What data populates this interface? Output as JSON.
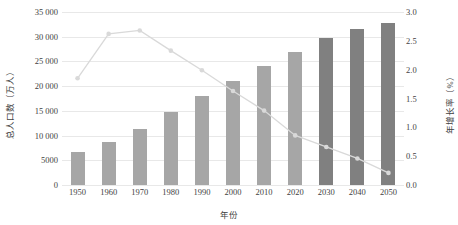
{
  "chart_data": {
    "type": "bar",
    "title": "",
    "xlabel": "年份",
    "ylabel": "总人口数（万人）",
    "y2label": "年增长率（%）",
    "categories": [
      "1950",
      "1960",
      "1970",
      "1980",
      "1990",
      "2000",
      "2010",
      "2020",
      "2030",
      "2040",
      "2050"
    ],
    "ylim": [
      0,
      35000
    ],
    "y2lim": [
      0,
      3.0
    ],
    "yticks": [
      "0",
      "5000",
      "10 000",
      "15 000",
      "20 000",
      "25 000",
      "30 000",
      "35 000"
    ],
    "ytick_values": [
      0,
      5000,
      10000,
      15000,
      20000,
      25000,
      30000,
      35000
    ],
    "y2ticks": [
      "0.0",
      "0.5",
      "1.0",
      "1.5",
      "2.0",
      "2.5",
      "3.0"
    ],
    "y2tick_values": [
      0.0,
      0.5,
      1.0,
      1.5,
      2.0,
      2.5,
      3.0
    ],
    "grid": true,
    "legend": "none",
    "series": [
      {
        "name": "总人口数（万人）",
        "type": "bar",
        "axis": "left",
        "values": [
          6700,
          8700,
          11400,
          14700,
          18000,
          21000,
          24000,
          27000,
          29700,
          31600,
          32800
        ],
        "colors": [
          "hist",
          "hist",
          "hist",
          "hist",
          "hist",
          "hist",
          "hist",
          "hist",
          "proj",
          "proj",
          "proj"
        ]
      },
      {
        "name": "年增长率（%）",
        "type": "line",
        "axis": "right",
        "values": [
          1.85,
          2.62,
          2.68,
          2.33,
          1.99,
          1.63,
          1.29,
          0.86,
          0.66,
          0.46,
          0.21
        ]
      }
    ]
  },
  "colors": {
    "bar_historical": "#a6a6a6",
    "bar_projected": "#808080",
    "line": "#d9d9d9",
    "marker": "#d9d9d9",
    "grid": "#e8e8e8",
    "text": "#3f3f3f"
  }
}
